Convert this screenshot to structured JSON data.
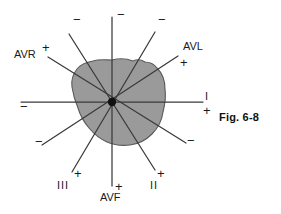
{
  "figure": {
    "caption": "Fig. 6-8",
    "center": {
      "x": 112,
      "y": 102
    },
    "colors": {
      "loop_fill": "#9a9a9a",
      "loop_stroke": "#5a5a5a",
      "axis_line": "#3a3a3a",
      "text": "#1a1a1a",
      "background": "#ffffff"
    }
  },
  "leads": [
    {
      "id": "lead-i",
      "name": "I",
      "positive_label": "+",
      "negative_label": "−",
      "positive_end": {
        "x": 203,
        "y": 102
      },
      "negative_end": {
        "x": 21,
        "y": 102
      },
      "label_pos": {
        "x": 205,
        "y": 95
      },
      "plus_pos": {
        "x": 203,
        "y": 104
      },
      "minus_pos": {
        "x": 22,
        "y": 103
      }
    },
    {
      "id": "lead-avf",
      "name": "AVF",
      "positive_label": "+",
      "negative_label": "−",
      "positive_end": {
        "x": 112,
        "y": 186
      },
      "negative_end": {
        "x": 112,
        "y": 17
      },
      "label_pos": {
        "x": 100,
        "y": 193
      },
      "plus_pos": {
        "x": 115,
        "y": 178
      },
      "minus_pos": {
        "x": 117,
        "y": 10
      }
    },
    {
      "id": "lead-ii",
      "name": "II",
      "positive_label": "+",
      "negative_label": "−",
      "positive_end": {
        "x": 155,
        "y": 170
      },
      "negative_end": {
        "x": 69,
        "y": 34
      },
      "label_pos": {
        "x": 150,
        "y": 182
      },
      "plus_pos": {
        "x": 157,
        "y": 168
      },
      "minus_pos": {
        "x": 74,
        "y": 16
      }
    },
    {
      "id": "lead-iii",
      "name": "III",
      "positive_label": "+",
      "negative_label": "−",
      "positive_end": {
        "x": 72,
        "y": 172
      },
      "negative_end": {
        "x": 155,
        "y": 32
      },
      "label_pos": {
        "x": 58,
        "y": 182
      },
      "plus_pos": {
        "x": 74,
        "y": 169
      },
      "minus_pos": {
        "x": 158,
        "y": 16
      }
    },
    {
      "id": "lead-avr",
      "name": "AVR",
      "positive_label": "+",
      "negative_label": "−",
      "positive_end": {
        "x": 48,
        "y": 57
      },
      "negative_end": {
        "x": 186,
        "y": 143
      },
      "label_pos": {
        "x": 15,
        "y": 54
      },
      "plus_pos": {
        "x": 43,
        "y": 44
      },
      "minus_pos": {
        "x": 188,
        "y": 137
      }
    },
    {
      "id": "lead-avl",
      "name": "AVL",
      "positive_label": "+",
      "negative_label": "−",
      "positive_end": {
        "x": 178,
        "y": 56
      },
      "negative_end": {
        "x": 42,
        "y": 145
      },
      "label_pos": {
        "x": 184,
        "y": 45
      },
      "plus_pos": {
        "x": 180,
        "y": 58
      },
      "minus_pos": {
        "x": 36,
        "y": 140
      }
    }
  ],
  "vector_loop": {
    "name": "qrs-loop",
    "description": "shaded irregular vector loop area"
  }
}
